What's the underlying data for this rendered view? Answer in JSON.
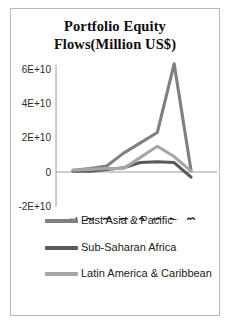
{
  "chart_data": {
    "type": "line",
    "title": "Portfolio Equity Flows(Million US$)",
    "title_line1": "Portfolio Equity",
    "title_line2": "Flows(Million US$)",
    "xlabel": "",
    "ylabel": "",
    "grid": false,
    "legend_position": "bottom",
    "categories": [
      "2001",
      "2002",
      "2003",
      "2004",
      "2005",
      "2006",
      "2007",
      "2008"
    ],
    "x": [
      2001,
      2002,
      2003,
      2004,
      2005,
      2006,
      2007,
      2008
    ],
    "ylim": [
      -20000000000,
      60000000000
    ],
    "ytick_labels": [
      "6E+10",
      "4E+10",
      "2E+10",
      "0",
      "-2E+10"
    ],
    "ytick_values": [
      60000000000,
      40000000000,
      20000000000,
      0,
      -20000000000
    ],
    "series": [
      {
        "name": "East Asia & Pacific",
        "color": "#808080",
        "values": [
          1000000000,
          2000000000,
          3500000000,
          11000000000,
          17000000000,
          23000000000,
          63000000000,
          1000000000
        ]
      },
      {
        "name": "Sub-Saharan Africa",
        "color": "#595959",
        "values": [
          500000000,
          500000000,
          1500000000,
          2500000000,
          5500000000,
          6000000000,
          5500000000,
          -3000000000
        ]
      },
      {
        "name": "Latin America & Caribbean",
        "color": "#a6a6a6",
        "values": [
          1000000000,
          1500000000,
          2000000000,
          2000000000,
          8500000000,
          15000000000,
          9000000000,
          500000000
        ]
      }
    ]
  },
  "legend": {
    "items": [
      {
        "label": "East Asia & Pacific",
        "color": "#808080"
      },
      {
        "label": "Sub-Saharan Africa",
        "color": "#595959"
      },
      {
        "label": "Latin America & Caribbean",
        "color": "#a6a6a6"
      }
    ]
  }
}
